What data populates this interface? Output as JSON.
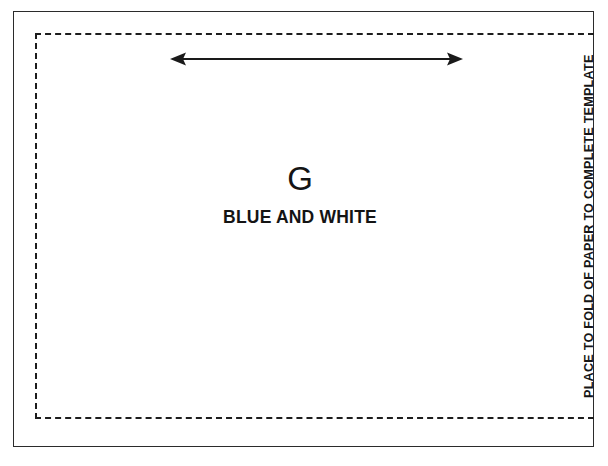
{
  "document": {
    "type": "sewing-pattern-template-piece",
    "title": "G BLUE AND WHITE"
  },
  "template": {
    "piece_code": "G",
    "fabric_label": "BLUE AND WHITE",
    "fold_instruction": "PLACE TO FOLD OF PAPER TO COMPLETE TEMPLATE"
  },
  "annotations": {
    "width_arrow_name": "grainline-double-arrow"
  },
  "icons": {
    "arrow_left_head": "arrow-left-head",
    "arrow_right_head": "arrow-right-head"
  },
  "colors": {
    "outer_border": "#2b2b2b",
    "dashed_border": "#1d1d1d",
    "text": "#141414",
    "background": "#ffffff"
  }
}
